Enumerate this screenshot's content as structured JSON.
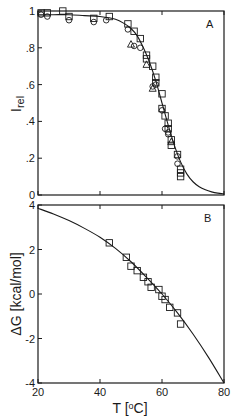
{
  "chart_data": [
    {
      "panel": "A",
      "type": "scatter",
      "title": "",
      "panel_label": "A",
      "xlabel": "T [oC]",
      "ylabel": "I_rel",
      "ylabel_main": "I",
      "ylabel_sub": "rel",
      "xlim": [
        20,
        80
      ],
      "ylim": [
        0,
        1
      ],
      "x_ticks": [
        20,
        40,
        60,
        80
      ],
      "y_ticks": [
        0,
        0.2,
        0.4,
        0.6,
        0.8,
        1
      ],
      "y_tick_labels": [
        "0",
        ".2",
        ".4",
        ".6",
        ".8",
        "1"
      ],
      "grid": false,
      "legend": null,
      "series": [
        {
          "name": "squares",
          "marker": "square",
          "points": [
            [
              21,
              0.99
            ],
            [
              23,
              0.99
            ],
            [
              28,
              1.0
            ],
            [
              30,
              0.97
            ],
            [
              38,
              0.96
            ],
            [
              43,
              0.97
            ],
            [
              49,
              0.93
            ],
            [
              51,
              0.89
            ],
            [
              53,
              0.85
            ],
            [
              55,
              0.76
            ],
            [
              55,
              0.74
            ],
            [
              57,
              0.7
            ],
            [
              58,
              0.64
            ],
            [
              58,
              0.61
            ],
            [
              60,
              0.55
            ],
            [
              60,
              0.47
            ],
            [
              61,
              0.43
            ],
            [
              62,
              0.39
            ],
            [
              62,
              0.36
            ],
            [
              63,
              0.3
            ],
            [
              63,
              0.27
            ],
            [
              65,
              0.22
            ],
            [
              66,
              0.14
            ],
            [
              66,
              0.12
            ],
            [
              66,
              0.1
            ]
          ]
        },
        {
          "name": "circles",
          "marker": "circle",
          "points": [
            [
              21,
              0.98
            ],
            [
              23,
              0.97
            ],
            [
              30,
              0.95
            ],
            [
              38,
              0.94
            ],
            [
              42,
              0.95
            ],
            [
              49,
              0.9
            ],
            [
              51,
              0.81
            ],
            [
              53,
              0.8
            ],
            [
              57,
              0.59
            ],
            [
              58,
              0.6
            ],
            [
              60,
              0.46
            ],
            [
              61,
              0.36
            ],
            [
              62,
              0.34
            ],
            [
              62,
              0.33
            ],
            [
              65,
              0.21
            ],
            [
              65,
              0.17
            ]
          ]
        },
        {
          "name": "triangles",
          "marker": "triangle",
          "points": [
            [
              50,
              0.82
            ],
            [
              55,
              0.71
            ],
            [
              57,
              0.58
            ],
            [
              63,
              0.29
            ]
          ]
        },
        {
          "name": "fit",
          "type": "line",
          "x": [
            20,
            25,
            30,
            35,
            40,
            45,
            48,
            50,
            52,
            54,
            56,
            58,
            60,
            62,
            64,
            66,
            68,
            70,
            72,
            74,
            76,
            78,
            80
          ],
          "values": [
            0.98,
            0.98,
            0.98,
            0.975,
            0.97,
            0.955,
            0.93,
            0.905,
            0.865,
            0.8,
            0.72,
            0.62,
            0.5,
            0.38,
            0.27,
            0.18,
            0.115,
            0.072,
            0.045,
            0.028,
            0.017,
            0.01,
            0.006
          ]
        }
      ]
    },
    {
      "panel": "B",
      "type": "scatter",
      "title": "",
      "panel_label": "B",
      "xlabel": "T [oC]",
      "ylabel": "ΔG [kcal/mol]",
      "xlim": [
        20,
        80
      ],
      "ylim": [
        -4,
        4
      ],
      "x_ticks": [
        20,
        40,
        60,
        80
      ],
      "x_tick_labels": [
        "20",
        "40",
        "60",
        "80"
      ],
      "y_ticks": [
        -4,
        -2,
        0,
        2,
        4
      ],
      "y_tick_labels": [
        "-4",
        "-2",
        "0",
        "2",
        "4"
      ],
      "grid": false,
      "legend": null,
      "series": [
        {
          "name": "squares",
          "marker": "square",
          "points": [
            [
              43,
              2.3
            ],
            [
              48.5,
              1.65
            ],
            [
              50,
              1.25
            ],
            [
              52,
              1.05
            ],
            [
              54,
              0.75
            ],
            [
              55.5,
              0.55
            ],
            [
              56.5,
              0.3
            ],
            [
              59,
              0.2
            ],
            [
              60,
              -0.1
            ],
            [
              61,
              -0.25
            ],
            [
              62.5,
              -0.6
            ],
            [
              65,
              -0.85
            ],
            [
              66,
              -1.35
            ]
          ]
        },
        {
          "name": "fit",
          "type": "line",
          "x": [
            20,
            25,
            30,
            35,
            40,
            45,
            50,
            55,
            60,
            65,
            70,
            75,
            80
          ],
          "values": [
            3.85,
            3.6,
            3.3,
            2.95,
            2.55,
            2.05,
            1.45,
            0.75,
            0.0,
            -0.85,
            -1.8,
            -2.85,
            -4.0
          ]
        }
      ]
    }
  ],
  "labels": {
    "panel_a": "A",
    "panel_b": "B",
    "x_axis": "T [oC]",
    "ya_main": "I",
    "ya_sub": "rel",
    "yb": "ΔG [kcal/mol]"
  }
}
